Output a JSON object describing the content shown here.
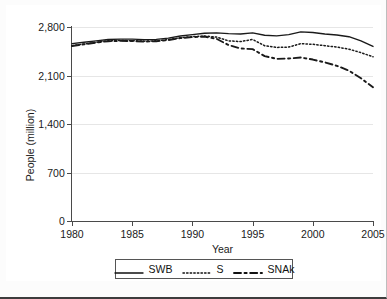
{
  "chart_data": {
    "type": "line",
    "title": "",
    "xlabel": "Year",
    "ylabel": "People (million)",
    "xlim": [
      1980,
      2005
    ],
    "ylim": [
      0,
      2800
    ],
    "xticks": [
      1980,
      1985,
      1990,
      1995,
      2000,
      2005
    ],
    "xtick_labels": [
      "1980",
      "1985",
      "1990",
      "1995",
      "2000",
      "2005"
    ],
    "yticks": [
      0,
      700,
      1400,
      2100,
      2800
    ],
    "ytick_labels": [
      "0",
      "700",
      "1,400",
      "2,100",
      "2,800"
    ],
    "grid": true,
    "grid_axis": "y",
    "legend_position": "below",
    "x": [
      1980,
      1981,
      1982,
      1983,
      1984,
      1985,
      1986,
      1987,
      1988,
      1989,
      1990,
      1991,
      1992,
      1993,
      1994,
      1995,
      1996,
      1997,
      1998,
      1999,
      2000,
      2001,
      2002,
      2003,
      2004,
      2005
    ],
    "series": [
      {
        "name": "SWB",
        "style": "solid",
        "color": "#1a1a1a",
        "values": [
          2560,
          2580,
          2600,
          2620,
          2625,
          2625,
          2618,
          2622,
          2640,
          2670,
          2690,
          2710,
          2715,
          2705,
          2700,
          2715,
          2680,
          2672,
          2690,
          2730,
          2720,
          2700,
          2685,
          2660,
          2600,
          2520
        ]
      },
      {
        "name": "S",
        "style": "dotted",
        "color": "#1a1a1a",
        "values": [
          2530,
          2555,
          2580,
          2600,
          2605,
          2602,
          2596,
          2600,
          2618,
          2645,
          2660,
          2670,
          2655,
          2600,
          2590,
          2620,
          2530,
          2505,
          2510,
          2560,
          2550,
          2530,
          2510,
          2480,
          2430,
          2370
        ]
      },
      {
        "name": "SNAk",
        "style": "dashed",
        "color": "#1a1a1a",
        "values": [
          2525,
          2550,
          2575,
          2595,
          2600,
          2598,
          2590,
          2595,
          2612,
          2640,
          2655,
          2662,
          2630,
          2540,
          2490,
          2480,
          2380,
          2340,
          2345,
          2360,
          2330,
          2290,
          2240,
          2170,
          2060,
          1930
        ]
      }
    ]
  },
  "legend": {
    "items": [
      {
        "label": "SWB",
        "style": "solid"
      },
      {
        "label": "S",
        "style": "dotted"
      },
      {
        "label": "SNAk",
        "style": "dashed"
      }
    ]
  }
}
